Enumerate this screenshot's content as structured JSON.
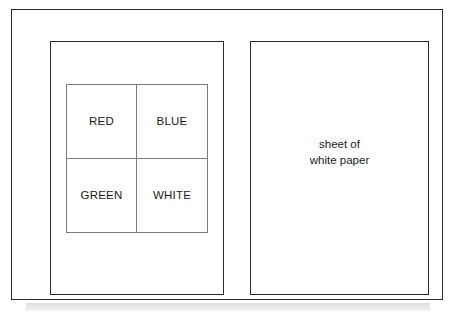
{
  "figure": {
    "outer_frame_label": "outer frame",
    "left_panel_label": "left panel",
    "right_panel_label": "right panel"
  },
  "color_grid": {
    "cells": [
      {
        "label": "RED"
      },
      {
        "label": "BLUE"
      },
      {
        "label": "GREEN"
      },
      {
        "label": "WHITE"
      }
    ]
  },
  "paper": {
    "caption_line_1": "sheet of",
    "caption_line_2": "white paper"
  },
  "colors": {
    "frame_stroke": "#2b2b2b",
    "grid_stroke": "#7a7c80",
    "text": "#1b1b1b",
    "background": "#ffffff",
    "shadow_band": "#d9dadc"
  }
}
